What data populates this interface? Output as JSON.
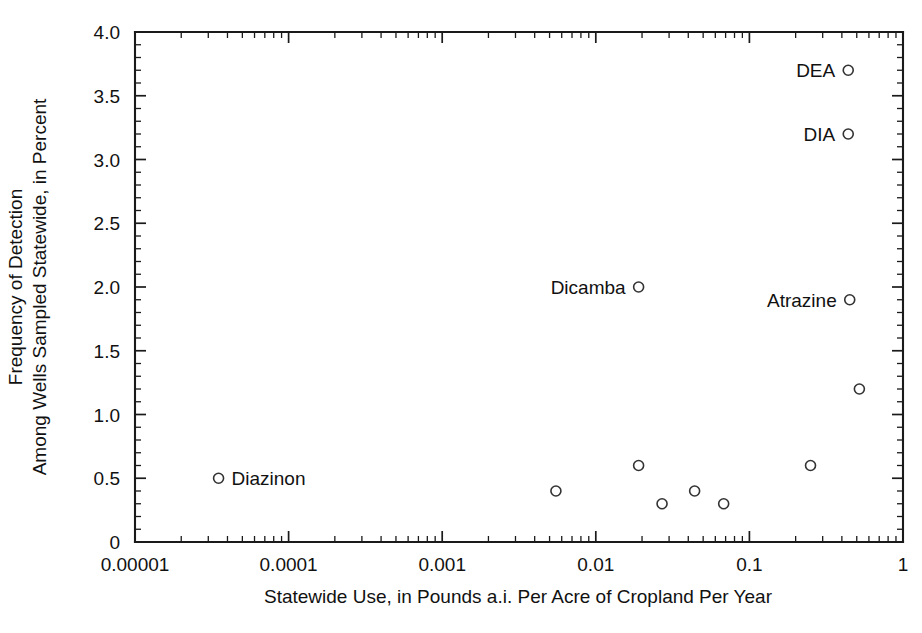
{
  "figure": {
    "width": 922,
    "height": 633,
    "background": "#ffffff",
    "ink_color": "#1a1a1a"
  },
  "chart_data": {
    "type": "scatter",
    "title": "",
    "xlabel": "Statewide Use, in Pounds a.i. Per Acre of Cropland Per Year",
    "ylabel_line1": "Frequency of Detection",
    "ylabel_line2": "Among Wells Sampled Statewide, in Percent",
    "xscale": "log",
    "yscale": "linear",
    "xlim": [
      1e-05,
      1
    ],
    "ylim": [
      0,
      4.0
    ],
    "grid": false,
    "legend": "none",
    "xticks": [
      1e-05,
      0.0001,
      0.001,
      0.01,
      0.1,
      1
    ],
    "xticklabels": [
      "0.00001",
      "0.0001",
      "0.001",
      "0.01",
      "0.1",
      "1"
    ],
    "yticks": [
      0,
      0.5,
      1.0,
      1.5,
      2.0,
      2.5,
      3.0,
      3.5,
      4.0
    ],
    "yticklabels": [
      "0",
      "0.5",
      "1.0",
      "1.5",
      "2.0",
      "2.5",
      "3.0",
      "3.5",
      "4.0"
    ],
    "yminor_step": 0.1,
    "marker_style": "open-circle",
    "marker_radius": 5,
    "points": [
      {
        "x": 3.5e-05,
        "y": 0.5,
        "label": "Diazinon",
        "label_side": "right"
      },
      {
        "x": 0.0055,
        "y": 0.4,
        "label": "",
        "label_side": ""
      },
      {
        "x": 0.019,
        "y": 2.0,
        "label": "Dicamba",
        "label_side": "left"
      },
      {
        "x": 0.019,
        "y": 0.6,
        "label": "",
        "label_side": ""
      },
      {
        "x": 0.027,
        "y": 0.3,
        "label": "",
        "label_side": ""
      },
      {
        "x": 0.044,
        "y": 0.4,
        "label": "",
        "label_side": ""
      },
      {
        "x": 0.068,
        "y": 0.3,
        "label": "",
        "label_side": ""
      },
      {
        "x": 0.25,
        "y": 0.6,
        "label": "",
        "label_side": ""
      },
      {
        "x": 0.44,
        "y": 3.7,
        "label": "DEA",
        "label_side": "left"
      },
      {
        "x": 0.44,
        "y": 3.2,
        "label": "DIA",
        "label_side": "left"
      },
      {
        "x": 0.45,
        "y": 1.9,
        "label": "Atrazine",
        "label_side": "left"
      },
      {
        "x": 0.52,
        "y": 1.2,
        "label": "",
        "label_side": ""
      }
    ]
  }
}
